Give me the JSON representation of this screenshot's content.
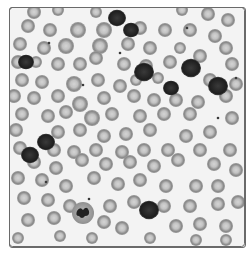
{
  "image": {
    "subject": "peripheral blood smear micrograph",
    "style": "grayscale",
    "colors": {
      "background": "#f3f3f3",
      "rbc_fill": "#8e8e8e",
      "rbc_center": "#cfcfcf",
      "wbc_nucleus": "#2a2a2a",
      "frame": "#6a6a6a"
    },
    "rbc": [
      [
        34,
        12,
        7
      ],
      [
        58,
        10,
        6
      ],
      [
        96,
        12,
        6
      ],
      [
        182,
        10,
        6
      ],
      [
        208,
        14,
        7
      ],
      [
        228,
        20,
        7
      ],
      [
        28,
        26,
        7
      ],
      [
        50,
        30,
        7
      ],
      [
        78,
        30,
        8
      ],
      [
        104,
        30,
        8
      ],
      [
        140,
        28,
        7
      ],
      [
        165,
        30,
        7
      ],
      [
        190,
        30,
        7
      ],
      [
        215,
        36,
        7
      ],
      [
        20,
        44,
        7
      ],
      [
        44,
        48,
        7
      ],
      [
        66,
        46,
        8
      ],
      [
        100,
        46,
        8
      ],
      [
        128,
        44,
        7
      ],
      [
        150,
        48,
        7
      ],
      [
        180,
        48,
        6
      ],
      [
        200,
        56,
        7
      ],
      [
        226,
        48,
        7
      ],
      [
        18,
        62,
        7
      ],
      [
        36,
        62,
        6
      ],
      [
        58,
        64,
        7
      ],
      [
        80,
        64,
        7
      ],
      [
        96,
        58,
        7
      ],
      [
        124,
        64,
        7
      ],
      [
        146,
        66,
        7
      ],
      [
        170,
        62,
        7
      ],
      [
        232,
        64,
        7
      ],
      [
        22,
        80,
        7
      ],
      [
        42,
        82,
        7
      ],
      [
        74,
        84,
        8
      ],
      [
        98,
        80,
        7
      ],
      [
        120,
        86,
        7
      ],
      [
        136,
        80,
        6
      ],
      [
        158,
        78,
        6
      ],
      [
        210,
        80,
        7
      ],
      [
        236,
        84,
        7
      ],
      [
        14,
        96,
        7
      ],
      [
        34,
        98,
        7
      ],
      [
        58,
        96,
        7
      ],
      [
        80,
        104,
        8
      ],
      [
        104,
        98,
        7
      ],
      [
        134,
        96,
        7
      ],
      [
        154,
        100,
        7
      ],
      [
        176,
        100,
        7
      ],
      [
        198,
        102,
        7
      ],
      [
        226,
        96,
        7
      ],
      [
        22,
        114,
        7
      ],
      [
        48,
        116,
        7
      ],
      [
        66,
        112,
        7
      ],
      [
        92,
        118,
        8
      ],
      [
        112,
        114,
        7
      ],
      [
        140,
        116,
        7
      ],
      [
        164,
        114,
        7
      ],
      [
        190,
        114,
        7
      ],
      [
        232,
        118,
        7
      ],
      [
        16,
        130,
        7
      ],
      [
        58,
        132,
        7
      ],
      [
        80,
        130,
        7
      ],
      [
        104,
        136,
        7
      ],
      [
        126,
        134,
        7
      ],
      [
        150,
        130,
        7
      ],
      [
        186,
        136,
        7
      ],
      [
        210,
        132,
        7
      ],
      [
        20,
        148,
        7
      ],
      [
        54,
        150,
        7
      ],
      [
        74,
        152,
        7
      ],
      [
        96,
        150,
        7
      ],
      [
        122,
        152,
        7
      ],
      [
        144,
        150,
        7
      ],
      [
        168,
        150,
        7
      ],
      [
        200,
        150,
        7
      ],
      [
        230,
        150,
        7
      ],
      [
        34,
        162,
        7
      ],
      [
        56,
        168,
        7
      ],
      [
        82,
        160,
        7
      ],
      [
        106,
        164,
        7
      ],
      [
        130,
        162,
        7
      ],
      [
        154,
        166,
        7
      ],
      [
        178,
        160,
        7
      ],
      [
        214,
        164,
        7
      ],
      [
        236,
        170,
        7
      ],
      [
        18,
        178,
        7
      ],
      [
        42,
        180,
        7
      ],
      [
        66,
        186,
        7
      ],
      [
        94,
        178,
        7
      ],
      [
        118,
        184,
        7
      ],
      [
        140,
        180,
        7
      ],
      [
        166,
        186,
        7
      ],
      [
        196,
        186,
        7
      ],
      [
        218,
        186,
        7
      ],
      [
        24,
        198,
        7
      ],
      [
        48,
        200,
        7
      ],
      [
        70,
        206,
        7
      ],
      [
        110,
        206,
        7
      ],
      [
        134,
        202,
        7
      ],
      [
        164,
        206,
        7
      ],
      [
        190,
        206,
        7
      ],
      [
        218,
        204,
        7
      ],
      [
        238,
        202,
        7
      ],
      [
        28,
        220,
        7
      ],
      [
        54,
        218,
        7
      ],
      [
        104,
        222,
        7
      ],
      [
        122,
        228,
        7
      ],
      [
        176,
        226,
        7
      ],
      [
        200,
        224,
        7
      ],
      [
        226,
        226,
        7
      ],
      [
        18,
        238,
        6
      ],
      [
        60,
        236,
        6
      ],
      [
        92,
        238,
        6
      ],
      [
        150,
        238,
        6
      ],
      [
        196,
        240,
        6
      ],
      [
        226,
        240,
        6
      ]
    ],
    "wbc": [
      {
        "x": 26,
        "y": 62,
        "r": 8,
        "type": "lymphocyte"
      },
      {
        "x": 117,
        "y": 18,
        "r": 9,
        "type": "lymphocyte"
      },
      {
        "x": 131,
        "y": 30,
        "r": 8,
        "type": "lymphocyte"
      },
      {
        "x": 144,
        "y": 72,
        "r": 10,
        "type": "lymphocyte"
      },
      {
        "x": 191,
        "y": 68,
        "r": 10,
        "type": "lymphocyte"
      },
      {
        "x": 171,
        "y": 88,
        "r": 8,
        "type": "lymphocyte"
      },
      {
        "x": 218,
        "y": 86,
        "r": 10,
        "type": "monocyte"
      },
      {
        "x": 46,
        "y": 142,
        "r": 9,
        "type": "lymphocyte"
      },
      {
        "x": 30,
        "y": 155,
        "r": 9,
        "type": "lymphocyte"
      },
      {
        "x": 83,
        "y": 213,
        "r": 11,
        "type": "neutrophil"
      },
      {
        "x": 149,
        "y": 210,
        "r": 10,
        "type": "lymphocyte"
      }
    ],
    "platelets": [
      [
        49,
        43
      ],
      [
        120,
        53
      ],
      [
        83,
        85
      ],
      [
        187,
        28
      ],
      [
        218,
        118
      ],
      [
        46,
        182
      ],
      [
        89,
        199
      ],
      [
        236,
        78
      ]
    ]
  }
}
